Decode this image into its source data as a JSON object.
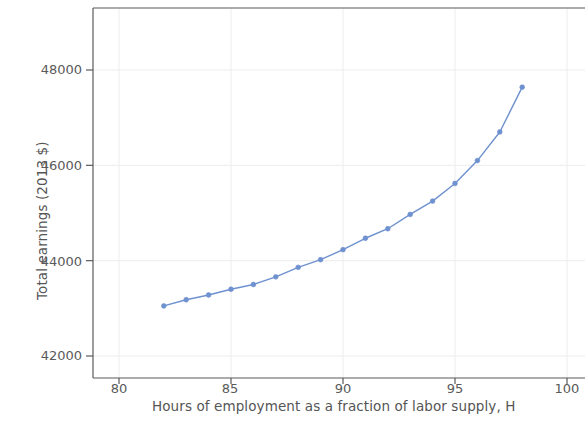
{
  "chart_data": {
    "type": "line",
    "title": "",
    "subtitle": "",
    "xlabel": "Hours of employment as a fraction of labor supply, H",
    "ylabel": "Total earnings (2013 $)",
    "xlim": [
      78.5,
      101
    ],
    "ylim": [
      41200,
      48900
    ],
    "xticks": [
      80,
      85,
      90,
      95,
      100
    ],
    "xtick_labels": [
      "80",
      "85",
      "90",
      "95",
      "100"
    ],
    "yticks": [
      42000,
      44000,
      46000,
      48000
    ],
    "ytick_labels": [
      "42000",
      "46000",
      "44000",
      "48000"
    ],
    "grid": "horizontal-faint",
    "legend": "none",
    "marker": "circle",
    "line_color": "#6e91cf",
    "marker_color": "#6e91cf",
    "series": [
      {
        "name": "Total earnings",
        "x": [
          82,
          83,
          84,
          85,
          86,
          87,
          88,
          89,
          90,
          91,
          92,
          93,
          94,
          95,
          96,
          97,
          98
        ],
        "values": [
          43050,
          43180,
          43280,
          43400,
          43500,
          43660,
          43860,
          44020,
          44230,
          44470,
          44670,
          44970,
          45250,
          45620,
          46100,
          46700,
          47640
        ]
      }
    ]
  },
  "axes": {
    "y_tick_labels": [
      "48000",
      "46000",
      "44000",
      "42000"
    ],
    "x_tick_labels": [
      "80",
      "85",
      "90",
      "95",
      "100"
    ],
    "x_axis_title": "Hours of employment as a fraction of labor supply, H",
    "y_axis_title": "Total earnings (2013 $)"
  },
  "colors": {
    "series": "#6e91cf",
    "frame": "#5a5a5a",
    "grid": "#ededed",
    "text": "#555555",
    "background": "#ffffff"
  }
}
